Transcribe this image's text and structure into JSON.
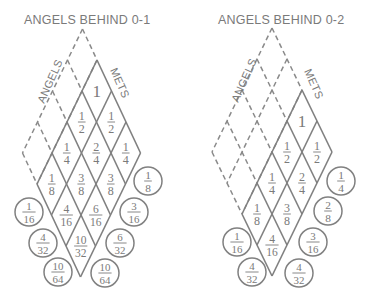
{
  "colors": {
    "line": "#808080",
    "text": "#7a7a7a",
    "background": "#ffffff"
  },
  "diagrams": [
    {
      "id": "left",
      "title": "ANGELS BEHIND 0-1",
      "title_pos": [
        24,
        24
      ],
      "apex": [
        97,
        60
      ],
      "u": [
        -15,
        31
      ],
      "v": [
        14.5,
        31
      ],
      "solid_i": [
        0,
        4
      ],
      "solid_j": [
        0,
        3
      ],
      "dashed_i": [
        0,
        4
      ],
      "dashed_j": [
        -1,
        0
      ],
      "angels_label": {
        "text": "ANGELS",
        "pos": [
          44,
          104
        ],
        "rotate": -66
      },
      "mets_label": {
        "text": "METS",
        "pos": [
          110,
          70
        ],
        "rotate": 66
      },
      "cells": [
        {
          "i": 0,
          "j": 0,
          "value": "1"
        },
        {
          "i": 1,
          "j": 0,
          "value": "1/2"
        },
        {
          "i": 0,
          "j": 1,
          "value": "1/2"
        },
        {
          "i": 2,
          "j": 0,
          "value": "1/4"
        },
        {
          "i": 1,
          "j": 1,
          "value": "2/4"
        },
        {
          "i": 0,
          "j": 2,
          "value": "1/4"
        },
        {
          "i": 3,
          "j": 0,
          "value": "1/8"
        },
        {
          "i": 2,
          "j": 1,
          "value": "3/8"
        },
        {
          "i": 1,
          "j": 2,
          "value": "3/8"
        },
        {
          "i": 3,
          "j": 1,
          "value": "4/16"
        },
        {
          "i": 2,
          "j": 2,
          "value": "6/16"
        },
        {
          "i": 3,
          "j": 2,
          "value": "10/32"
        }
      ],
      "circles": [
        {
          "x": 148,
          "y": 181,
          "value": "1/8"
        },
        {
          "x": 29,
          "y": 212,
          "value": "1/16"
        },
        {
          "x": 134,
          "y": 212,
          "value": "3/16"
        },
        {
          "x": 43,
          "y": 243,
          "value": "4/32"
        },
        {
          "x": 120,
          "y": 243,
          "value": "6/32"
        },
        {
          "x": 58,
          "y": 272,
          "value": "10/64"
        },
        {
          "x": 105,
          "y": 273,
          "value": "10/64"
        }
      ]
    },
    {
      "id": "right",
      "title": "ANGELS BEHIND 0-2",
      "title_pos": [
        218,
        24
      ],
      "apex": [
        302,
        90
      ],
      "u": [
        -15,
        31
      ],
      "v": [
        15,
        31
      ],
      "solid_i": [
        0,
        4
      ],
      "solid_j": [
        0,
        2
      ],
      "dashed_i": [
        0,
        4
      ],
      "dashed_j": [
        -2,
        0
      ],
      "angels_label": {
        "text": "ANGELS",
        "pos": [
          238,
          103
        ],
        "rotate": -66
      },
      "mets_label": {
        "text": "METS",
        "pos": [
          304,
          71
        ],
        "rotate": 66
      },
      "cells": [
        {
          "i": 0,
          "j": 0,
          "value": "1"
        },
        {
          "i": 1,
          "j": 0,
          "value": "1/2"
        },
        {
          "i": 0,
          "j": 1,
          "value": "1/2"
        },
        {
          "i": 2,
          "j": 0,
          "value": "1/4"
        },
        {
          "i": 1,
          "j": 1,
          "value": "2/4"
        },
        {
          "i": 3,
          "j": 0,
          "value": "1/8"
        },
        {
          "i": 2,
          "j": 1,
          "value": "3/8"
        },
        {
          "i": 3,
          "j": 1,
          "value": "4/16"
        }
      ],
      "circles": [
        {
          "x": 341,
          "y": 181,
          "value": "1/4"
        },
        {
          "x": 328,
          "y": 211,
          "value": "2/8"
        },
        {
          "x": 237,
          "y": 242,
          "value": "1/16"
        },
        {
          "x": 313,
          "y": 242,
          "value": "3/16"
        },
        {
          "x": 252,
          "y": 272,
          "value": "4/32"
        },
        {
          "x": 299,
          "y": 273,
          "value": "4/32"
        }
      ]
    }
  ]
}
